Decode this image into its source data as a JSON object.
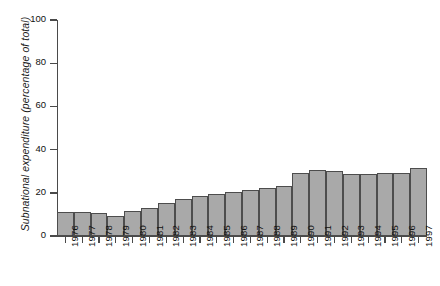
{
  "chart_data": {
    "type": "bar",
    "title": "",
    "xlabel": "",
    "ylabel": "Subnational expenditure (percentage of total)",
    "ylim": [
      0,
      100
    ],
    "yticks": [
      0,
      20,
      40,
      60,
      80,
      100
    ],
    "grid": false,
    "legend": "none",
    "bar_color": "#a9a9a9",
    "bar_edge_color": "#4d4d4d",
    "axis_color": "#4a4a4a",
    "categories": [
      "1976",
      "1977",
      "1978",
      "1979",
      "1980",
      "1981",
      "1982",
      "1983",
      "1984",
      "1985",
      "1986",
      "1987",
      "1988",
      "1989",
      "1990",
      "1991",
      "1992",
      "1993",
      "1994",
      "1995",
      "1996",
      "1997"
    ],
    "values": [
      11.2,
      11.2,
      10.6,
      9.4,
      11.5,
      13.0,
      15.5,
      17.2,
      18.3,
      19.6,
      20.2,
      21.2,
      22.1,
      23.3,
      29.0,
      30.6,
      30.2,
      28.8,
      28.6,
      29.2,
      29.3,
      31.4
    ]
  }
}
